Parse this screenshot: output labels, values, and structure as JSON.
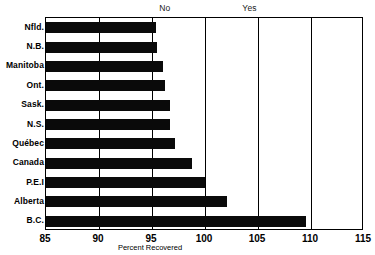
{
  "chart_data": {
    "type": "bar",
    "orientation": "horizontal",
    "title": "",
    "xlabel": "Percent Recovered",
    "ylabel": "",
    "xlim": [
      85,
      115
    ],
    "xticks": [
      85,
      90,
      95,
      100,
      105,
      110,
      115
    ],
    "grid": true,
    "gridlines_x": [
      90,
      95,
      100,
      105,
      110
    ],
    "legend_position": "none",
    "bar_color": "#0a0a0a",
    "categories": [
      "Nfld.",
      "N.B.",
      "Manitoba",
      "Ont.",
      "Sask.",
      "N.S.",
      "Québec",
      "Canada",
      "P.E.I",
      "Alberta",
      "B.C."
    ],
    "values": [
      95.4,
      95.5,
      96.0,
      96.2,
      96.7,
      96.7,
      97.2,
      98.8,
      100.0,
      102.1,
      109.5
    ],
    "annotations": [
      {
        "text": "No",
        "x": 96.3,
        "position": "top"
      },
      {
        "text": "Yes",
        "x": 104.3,
        "position": "top"
      }
    ]
  }
}
